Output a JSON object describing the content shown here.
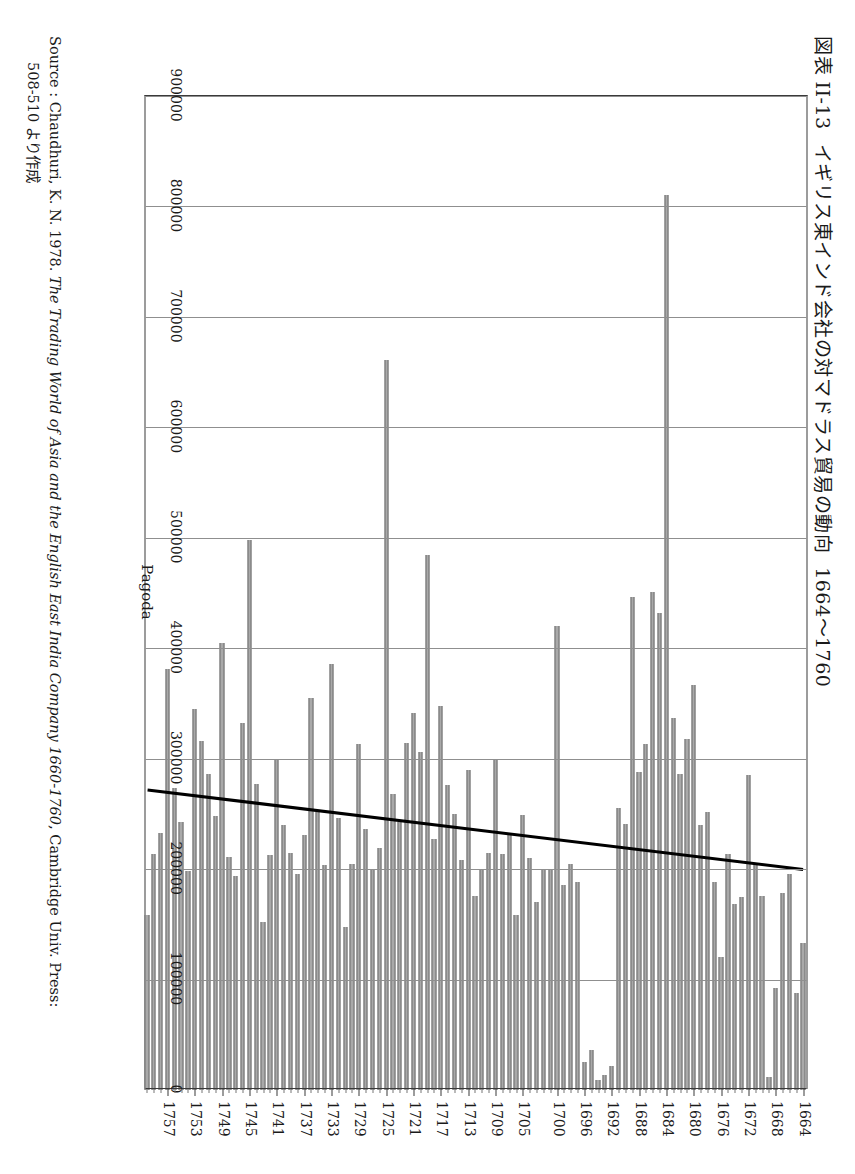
{
  "figure": {
    "title_number": "図表 II-13",
    "title_text": "イギリス東インド会社の対マドラス貿易の動向",
    "title_years": "1664〜1760"
  },
  "source": {
    "label": "Source : ",
    "author_year": "Chaudhuri, K. N. 1978. ",
    "work_italic": "The Trading World of Asia and the English East India Company 1660-1760",
    "publisher": ", Cambridge Univ. Press:",
    "pages_line": "508-510 より作成"
  },
  "chart_data": {
    "type": "bar",
    "orientation": "horizontal",
    "xlabel": "Pagoda",
    "ylabel": "",
    "value_axis_label": "Pagoda",
    "value_axis_ticks": [
      "0",
      "100000",
      "200000",
      "300000",
      "400000",
      "500000",
      "600000",
      "700000",
      "800000",
      "900000"
    ],
    "value_axis_tick_values": [
      0,
      100000,
      200000,
      300000,
      400000,
      500000,
      600000,
      700000,
      800000,
      900000
    ],
    "xlim": [
      0,
      900000
    ],
    "grid": true,
    "grid_axis": "value",
    "legend": "none",
    "bar_color": "#a9a9a9",
    "bar_edge_color": "#6f6f6f",
    "trendline_color": "#000000",
    "category_tick_labels": [
      "1664",
      "1668",
      "1672",
      "1676",
      "1680",
      "1684",
      "1688",
      "1692",
      "1696",
      "1700",
      "1705",
      "1709",
      "1713",
      "1717",
      "1721",
      "1725",
      "1729",
      "1733",
      "1737",
      "1741",
      "1745",
      "1749",
      "1753",
      "1757"
    ],
    "categories": [
      1664,
      1665,
      1666,
      1667,
      1668,
      1669,
      1670,
      1671,
      1672,
      1673,
      1674,
      1675,
      1676,
      1677,
      1678,
      1679,
      1680,
      1681,
      1682,
      1683,
      1684,
      1685,
      1686,
      1687,
      1688,
      1689,
      1690,
      1691,
      1692,
      1693,
      1694,
      1695,
      1696,
      1697,
      1698,
      1699,
      1700,
      1701,
      1702,
      1703,
      1704,
      1705,
      1706,
      1707,
      1708,
      1709,
      1710,
      1711,
      1712,
      1713,
      1714,
      1715,
      1716,
      1717,
      1718,
      1719,
      1720,
      1721,
      1722,
      1723,
      1724,
      1725,
      1726,
      1727,
      1728,
      1729,
      1730,
      1731,
      1732,
      1733,
      1734,
      1735,
      1736,
      1737,
      1738,
      1739,
      1740,
      1741,
      1742,
      1743,
      1744,
      1745,
      1746,
      1747,
      1748,
      1749,
      1750,
      1751,
      1752,
      1753,
      1754,
      1755,
      1756,
      1757,
      1758,
      1759,
      1760
    ],
    "values": [
      133000,
      88000,
      196000,
      178000,
      92000,
      12000,
      176000,
      205000,
      285000,
      175000,
      168000,
      214000,
      120000,
      188000,
      252000,
      240000,
      367000,
      318000,
      286000,
      337000,
      810000,
      432000,
      451000,
      313000,
      288000,
      446000,
      241000,
      255000,
      22000,
      14000,
      9000,
      36000,
      25000,
      188000,
      205000,
      186000,
      420000,
      200000,
      199000,
      170000,
      210000,
      249000,
      158000,
      231000,
      214000,
      300000,
      215000,
      200000,
      176000,
      290000,
      208000,
      250000,
      276000,
      348000,
      227000,
      484000,
      306000,
      341000,
      314000,
      243000,
      268000,
      661000,
      219000,
      200000,
      236000,
      313000,
      205000,
      148000,
      246000,
      386000,
      204000,
      252000,
      355000,
      231000,
      196000,
      215000,
      240000,
      299000,
      213000,
      152000,
      277000,
      498000,
      332000,
      194000,
      211000,
      405000,
      248000,
      286000,
      316000,
      345000,
      198000,
      243000,
      273000,
      381000,
      233000,
      214000,
      158000
    ],
    "trendline": {
      "type": "linear",
      "start_category": 1664,
      "start_value": 199000,
      "end_category": 1760,
      "end_value": 271000,
      "note": "rising linear trend drawn across the series"
    }
  }
}
